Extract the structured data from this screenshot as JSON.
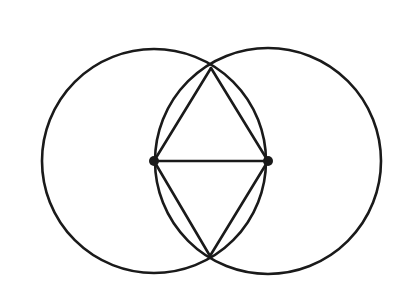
{
  "diagram": {
    "title": "",
    "stroke_color": "#1a1a1a",
    "background": "#ffffff",
    "circles": [
      {
        "name": "left-circle",
        "cx": 154,
        "cy": 161,
        "r": 112
      },
      {
        "name": "right-circle",
        "cx": 268,
        "cy": 161,
        "r": 113
      }
    ],
    "points": [
      {
        "name": "center-left",
        "x": 154,
        "y": 161,
        "label": ""
      },
      {
        "name": "center-right",
        "x": 268,
        "y": 161,
        "label": ""
      },
      {
        "name": "intersection-top",
        "x": 211,
        "y": 68,
        "label": ""
      },
      {
        "name": "intersection-bottom",
        "x": 210,
        "y": 256,
        "label": ""
      }
    ],
    "segments": [
      {
        "name": "baseline",
        "from": "center-left",
        "to": "center-right"
      },
      {
        "name": "left-to-top",
        "from": "center-left",
        "to": "intersection-top"
      },
      {
        "name": "right-to-top",
        "from": "center-right",
        "to": "intersection-top"
      },
      {
        "name": "left-to-bottom",
        "from": "center-left",
        "to": "intersection-bottom"
      },
      {
        "name": "right-to-bottom",
        "from": "center-right",
        "to": "intersection-bottom"
      }
    ]
  }
}
